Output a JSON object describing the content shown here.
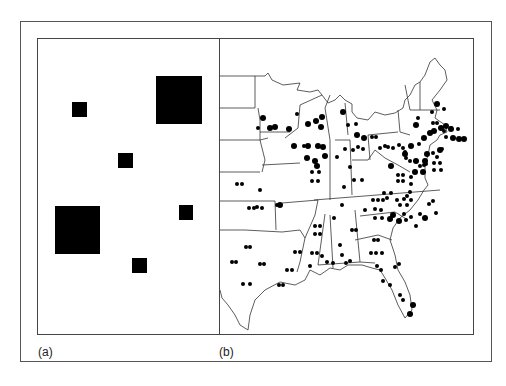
{
  "figure": {
    "panels": [
      {
        "id": "a",
        "label": "(a)",
        "description": "Abstract grid of black squares of two sizes"
      },
      {
        "id": "b",
        "label": "(b)",
        "description": "Map of eastern United States with dot symbols of two sizes"
      }
    ]
  },
  "panel_a": {
    "squares": [
      {
        "x": 72,
        "y": 102,
        "w": 15,
        "h": 15,
        "size": "small"
      },
      {
        "x": 156,
        "y": 76,
        "w": 46,
        "h": 48,
        "size": "large"
      },
      {
        "x": 118,
        "y": 153,
        "w": 15,
        "h": 15,
        "size": "small"
      },
      {
        "x": 55,
        "y": 206,
        "w": 45,
        "h": 48,
        "size": "large"
      },
      {
        "x": 179,
        "y": 205,
        "w": 14,
        "h": 15,
        "size": "small"
      },
      {
        "x": 132,
        "y": 258,
        "w": 15,
        "h": 15,
        "size": "small"
      }
    ]
  },
  "panel_b": {
    "colors": {
      "line": "#333333",
      "dot": "#000000"
    }
  }
}
